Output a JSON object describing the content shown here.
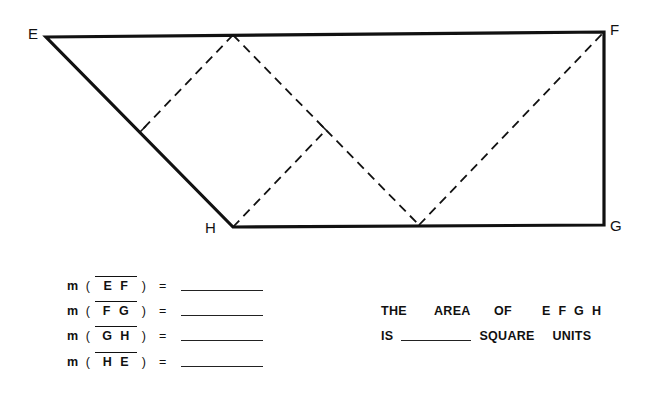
{
  "figure": {
    "stroke_color": "#111111",
    "vertices": {
      "E": {
        "label": "E",
        "x": 46,
        "y": 37
      },
      "F": {
        "label": "F",
        "x": 604,
        "y": 32
      },
      "G": {
        "label": "G",
        "x": 604,
        "y": 225
      },
      "H": {
        "label": "H",
        "x": 233,
        "y": 227
      }
    },
    "dashed_points": {
      "top_apex": {
        "x": 233,
        "y": 35
      },
      "left_foot_on_EH": {
        "x": 140,
        "y": 132
      },
      "mid_right": {
        "x": 326,
        "y": 130
      },
      "bottom_on_HG": {
        "x": 419,
        "y": 225
      }
    }
  },
  "measures": [
    {
      "prefix": "m",
      "open": "(",
      "segment": "E F",
      "close": ")",
      "eq": "=",
      "answer": ""
    },
    {
      "prefix": "m",
      "open": "(",
      "segment": "F G",
      "close": ")",
      "eq": "=",
      "answer": ""
    },
    {
      "prefix": "m",
      "open": "(",
      "segment": "G H",
      "close": ")",
      "eq": "=",
      "answer": ""
    },
    {
      "prefix": "m",
      "open": "(",
      "segment": "H E",
      "close": ")",
      "eq": "=",
      "answer": ""
    }
  ],
  "area_question": {
    "line1": [
      "THE",
      "AREA",
      "OF",
      "E F G H"
    ],
    "line2_prefix": "IS",
    "line2_answer": "",
    "line2_suffix": [
      "SQUARE",
      "UNITS"
    ]
  }
}
